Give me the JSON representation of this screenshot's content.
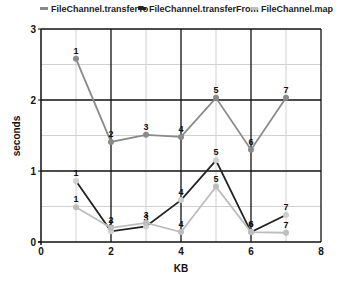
{
  "chart_data": {
    "type": "line",
    "title": "",
    "xlabel": "KB",
    "ylabel": "seconds",
    "xlim": [
      0,
      8
    ],
    "ylim": [
      0,
      3
    ],
    "x_ticks": [
      "0",
      "2",
      "4",
      "6",
      "8"
    ],
    "y_ticks": [
      "0",
      "1",
      "2",
      "3"
    ],
    "grid": true,
    "legend_position": "top",
    "x": [
      1,
      2,
      3,
      4,
      5,
      6,
      7
    ],
    "series": [
      {
        "name": "FileChannel.transferTo",
        "color": "#8a8a8a",
        "values": [
          2.58,
          1.41,
          1.51,
          1.48,
          2.03,
          1.3,
          2.03
        ],
        "point_labels": [
          "1",
          "2",
          "3",
          "4",
          "5",
          "6",
          "7"
        ]
      },
      {
        "name": "FileChannel.transferFrom",
        "color": "#222222",
        "values": [
          0.86,
          0.15,
          0.22,
          0.59,
          1.15,
          0.14,
          0.38
        ],
        "point_labels": [
          "1",
          "2",
          "3",
          "4",
          "5",
          "6",
          "7"
        ]
      },
      {
        "name": "FileChannel.map",
        "color": "#bdbdbd",
        "values": [
          0.49,
          0.2,
          0.27,
          0.14,
          0.78,
          0.14,
          0.13
        ],
        "point_labels": [
          "1",
          "2",
          "3",
          "4",
          "5",
          "6",
          "7"
        ]
      }
    ]
  },
  "legend": {
    "items": [
      {
        "label": "FileChannel.transferTo",
        "color": "#8a8a8a"
      },
      {
        "label": "FileChannel.transferFrom",
        "color": "#222222"
      },
      {
        "label": "FileChannel.map",
        "color": "#bdbdbd"
      }
    ]
  },
  "axes": {
    "xlabel": "KB",
    "ylabel": "seconds"
  }
}
